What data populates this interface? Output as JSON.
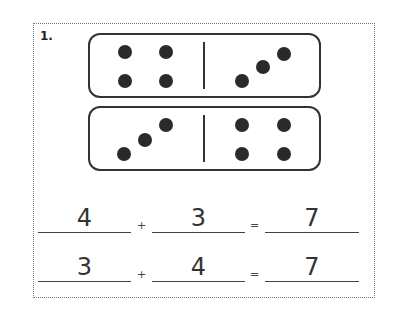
{
  "problem": {
    "number": "1.",
    "dominoes": [
      {
        "left_pips": 4,
        "right_pips": 3
      },
      {
        "left_pips": 3,
        "right_pips": 4
      }
    ],
    "equations": [
      {
        "addend1": "4",
        "plus": "+",
        "addend2": "3",
        "equals": "=",
        "sum": "7"
      },
      {
        "addend1": "3",
        "plus": "+",
        "addend2": "4",
        "equals": "=",
        "sum": "7"
      }
    ]
  },
  "colors": {
    "ink": "#2a2a2a",
    "border": "#333333",
    "frame": "#777777"
  }
}
